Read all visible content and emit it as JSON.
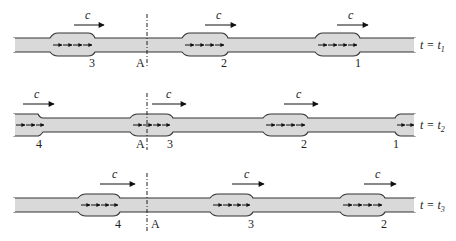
{
  "diagram": {
    "speed_label": "c",
    "point_label": "A",
    "colors": {
      "tube_fill": "#d9d9d9",
      "outline": "#333333",
      "arrow": "#111111"
    },
    "rows": [
      {
        "time_label": "t = t",
        "time_sub": "1",
        "pulses": [
          {
            "label": "3"
          },
          {
            "label": "2"
          },
          {
            "label": "1"
          }
        ]
      },
      {
        "time_label": "t = t",
        "time_sub": "2",
        "pulses": [
          {
            "label": "4"
          },
          {
            "label": "3"
          },
          {
            "label": "2"
          },
          {
            "label": "1"
          }
        ]
      },
      {
        "time_label": "t = t",
        "time_sub": "3",
        "pulses": [
          {
            "label": "4"
          },
          {
            "label": "3"
          },
          {
            "label": "2"
          }
        ]
      }
    ]
  }
}
